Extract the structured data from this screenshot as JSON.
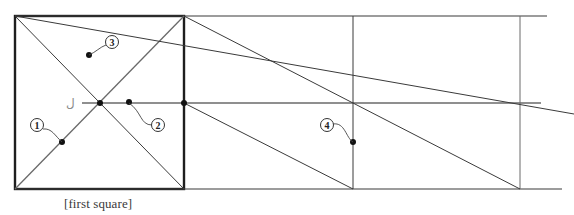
{
  "caption": "[first square]",
  "glyph": "ل",
  "colors": {
    "ink": "#2a2a2a",
    "light_ink": "#6a6a6a",
    "paper": "#ffffff"
  },
  "square": {
    "x1": 15,
    "y1": 16,
    "x2": 184,
    "y2": 189
  },
  "lines": [
    {
      "id": "top-line",
      "x1": 15,
      "y1": 16,
      "x2": 547,
      "y2": 16,
      "w": 1.2,
      "c": "#3a3a3a"
    },
    {
      "id": "bottom-line",
      "x1": 15,
      "y1": 189,
      "x2": 562,
      "y2": 189,
      "w": 1.2,
      "c": "#3a3a3a"
    },
    {
      "id": "mid-line",
      "x1": 82,
      "y1": 103,
      "x2": 541,
      "y2": 103,
      "w": 1.4,
      "c": "#6a6a6a"
    },
    {
      "id": "vertical-2",
      "x1": 353,
      "y1": 16,
      "x2": 353,
      "y2": 189,
      "w": 1,
      "c": "#3a3a3a"
    },
    {
      "id": "vertical-3",
      "x1": 520,
      "y1": 16,
      "x2": 520,
      "y2": 189,
      "w": 1,
      "c": "#6a6a6a"
    },
    {
      "id": "diag-down",
      "x1": 15,
      "y1": 16,
      "x2": 184,
      "y2": 189,
      "w": 1,
      "c": "#3a3a3a"
    },
    {
      "id": "diag-up",
      "x1": 15,
      "y1": 189,
      "x2": 184,
      "y2": 16,
      "w": 1.3,
      "c": "#6a6a6a"
    },
    {
      "id": "long-diag-a",
      "x1": 15,
      "y1": 16,
      "x2": 574,
      "y2": 114,
      "w": 1,
      "c": "#3a3a3a"
    },
    {
      "id": "long-diag-b",
      "x1": 184,
      "y1": 16,
      "x2": 520,
      "y2": 189,
      "w": 1,
      "c": "#3a3a3a"
    },
    {
      "id": "long-diag-c",
      "x1": 184,
      "y1": 103,
      "x2": 353,
      "y2": 189,
      "w": 1,
      "c": "#3a3a3a"
    }
  ],
  "points": [
    {
      "id": "center",
      "x": 100,
      "y": 103
    },
    {
      "id": "p1",
      "x": 62,
      "y": 142
    },
    {
      "id": "p2",
      "x": 129,
      "y": 102
    },
    {
      "id": "p3",
      "x": 89,
      "y": 55
    },
    {
      "id": "right-mid",
      "x": 184,
      "y": 103
    },
    {
      "id": "p4",
      "x": 353,
      "y": 142
    }
  ],
  "markers": [
    {
      "label": "1",
      "cx": 37,
      "cy": 125,
      "path": "M43,129 C52,128 55,136 62,142"
    },
    {
      "label": "2",
      "cx": 158,
      "cy": 125,
      "path": "M152,125 C140,125 142,112 129,103"
    },
    {
      "label": "3",
      "cx": 112,
      "cy": 42,
      "path": "M106,45 C100,47 96,52 89,55"
    },
    {
      "label": "4",
      "cx": 327,
      "cy": 125,
      "path": "M333,124 C345,122 346,138 353,142"
    }
  ]
}
